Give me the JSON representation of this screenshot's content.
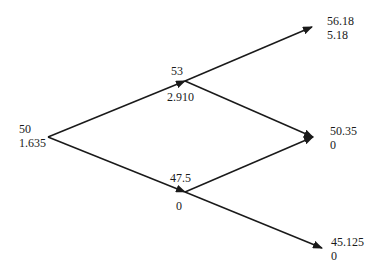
{
  "diagram": {
    "type": "binomial-tree",
    "nodes": [
      {
        "id": "root",
        "price": "50",
        "value": "1.635"
      },
      {
        "id": "up",
        "price": "53",
        "value": "2.910"
      },
      {
        "id": "down",
        "price": "47.5",
        "value": "0"
      },
      {
        "id": "up-up",
        "price": "56.18",
        "value": "5.18"
      },
      {
        "id": "up-down",
        "price": "50.35",
        "value": "0"
      },
      {
        "id": "down-down",
        "price": "45.125",
        "value": "0"
      }
    ],
    "edges": [
      {
        "from": "root",
        "to": "up"
      },
      {
        "from": "root",
        "to": "down"
      },
      {
        "from": "up",
        "to": "up-up"
      },
      {
        "from": "up",
        "to": "up-down"
      },
      {
        "from": "down",
        "to": "up-down"
      },
      {
        "from": "down",
        "to": "down-down"
      }
    ],
    "colors": {
      "line": "#1a1a1a",
      "background": "#ffffff"
    }
  }
}
